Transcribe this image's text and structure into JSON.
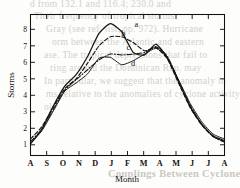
{
  "page": {
    "bleed_through_text": [
      "d from 132.1 and 116.4; 230.0 and",
      "Their frequency of tropical storms",
      "Gray (see ref. list, pp. 972). Hurricane",
      "orm between the Atlantic and eastern",
      "ase. The tropical depressions that fail to",
      "ring around the Dominican Rep. may",
      "In particular, we suggest that the anomaly in",
      "ms relative to the anomalies of cyclone activity",
      "ole",
      "Couplings Between Cyclones and ENSO"
    ]
  },
  "chart_data": {
    "type": "line",
    "title": "",
    "xlabel": "Month",
    "ylabel": "Storms",
    "x_ticklabels": [
      "A",
      "S",
      "O",
      "N",
      "D",
      "J",
      "F",
      "M",
      "A",
      "M",
      "J",
      "J",
      "A"
    ],
    "x_categories": [
      "Aug",
      "Sep",
      "Oct",
      "Nov",
      "Dec",
      "Jan",
      "Feb",
      "Mar",
      "Apr",
      "May",
      "Jun",
      "Jul",
      "Aug"
    ],
    "y_ticklabels": [
      "1",
      "2",
      "3",
      "4",
      "5",
      "6",
      "7",
      "8"
    ],
    "ylim": [
      0.35,
      8.9
    ],
    "xlim": [
      0,
      12
    ],
    "grid": false,
    "legend": "inline-curve-labels",
    "axis_box": true,
    "ticks_on_all_sides": true,
    "series": [
      {
        "name": "a",
        "label": "a",
        "style": "solid",
        "label_x": 6.55,
        "label_y": 8.15,
        "values": [
          1.05,
          1.95,
          3.35,
          4.55,
          5.25,
          6.35,
          7.75,
          8.35,
          7.85,
          6.6,
          6.45,
          7.1,
          6.25,
          4.8,
          3.3,
          2.25,
          1.55,
          1.25
        ]
      },
      {
        "name": "b",
        "label": "b",
        "style": "dashed",
        "label_x": 5.75,
        "label_y": 7.6,
        "values": [
          1.35,
          2.1,
          3.3,
          4.4,
          5.0,
          5.95,
          7.0,
          7.55,
          7.55,
          7.2,
          6.7,
          6.9,
          6.2,
          4.7,
          3.25,
          2.2,
          1.5,
          1.2
        ]
      },
      {
        "name": "c",
        "label": "c",
        "style": "dash-dot",
        "label_x": 6.05,
        "label_y": 6.75,
        "values": [
          1.2,
          1.95,
          3.15,
          4.3,
          4.95,
          5.55,
          6.15,
          6.5,
          6.45,
          6.5,
          6.6,
          6.95,
          6.35,
          4.85,
          3.4,
          2.25,
          1.5,
          1.15
        ]
      },
      {
        "name": "d",
        "label": "d",
        "style": "solid-thin",
        "label_x": 6.35,
        "label_y": 5.75,
        "values": [
          1.1,
          1.85,
          3.05,
          4.25,
          4.75,
          5.3,
          6.25,
          6.3,
          5.85,
          6.1,
          6.5,
          6.85,
          6.3,
          4.9,
          3.5,
          2.4,
          1.65,
          1.35
        ]
      }
    ]
  }
}
